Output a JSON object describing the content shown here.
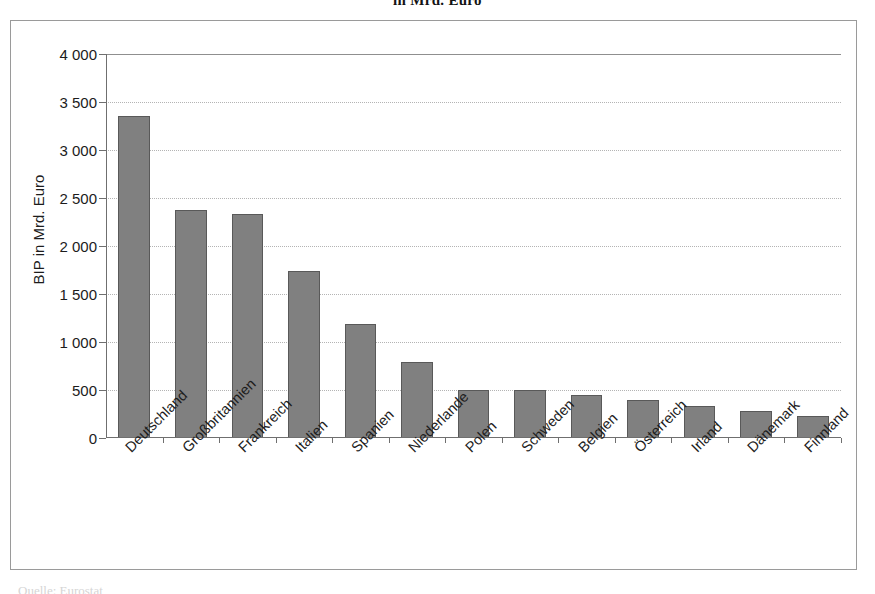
{
  "headline": "in Mrd. Euro",
  "footer_caption": "Quelle: Eurostat",
  "colors": {
    "bar_fill": "#808080",
    "bar_border": "#595959",
    "gridline": "#b4b4b4",
    "axis": "#6f6f6f",
    "frame": "#9a9a9a",
    "text": "#1c1c1c"
  },
  "chart_data": {
    "type": "bar",
    "title": "in Mrd. Euro",
    "xlabel": "",
    "ylabel": "BIP in Mrd. Euro",
    "ylim": [
      0,
      4000
    ],
    "ytick_values": [
      0,
      500,
      1000,
      1500,
      2000,
      2500,
      3000,
      3500,
      4000
    ],
    "ytick_labels": [
      "0",
      "500",
      "1 000",
      "1 500",
      "2 000",
      "2 500",
      "3 000",
      "3 500",
      "4 000"
    ],
    "grid": true,
    "legend": false,
    "categories": [
      "Deutschland",
      "Großbritannien",
      "Frankreich",
      "Italien",
      "Spanien",
      "Niederlande",
      "Polen",
      "Schweden",
      "Belgien",
      "Österreich",
      "Irland",
      "Dänemark",
      "Finnland"
    ],
    "values": [
      3350,
      2370,
      2330,
      1740,
      1185,
      790,
      500,
      500,
      450,
      400,
      330,
      285,
      230
    ]
  }
}
